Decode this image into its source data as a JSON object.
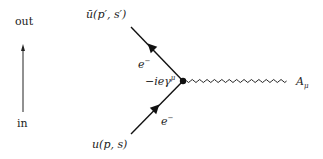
{
  "diagram": {
    "type": "feynman-vertex",
    "time_axis": {
      "top_label": "out",
      "bottom_label": "in"
    },
    "incoming": {
      "spinor": "u",
      "args": "(p, s)",
      "particle": "e",
      "charge": "−"
    },
    "outgoing": {
      "spinor": "ū",
      "args": "(p′, s′)",
      "particle": "e",
      "charge": "−"
    },
    "vertex": {
      "factor": "−iеγ",
      "factor_prefix": "−ie",
      "factor_gamma": "γ",
      "factor_index": "μ"
    },
    "photon": {
      "field": "A",
      "index": "μ"
    },
    "colors": {
      "line": "#111111",
      "text": "#222222",
      "background": "#ffffff"
    }
  }
}
